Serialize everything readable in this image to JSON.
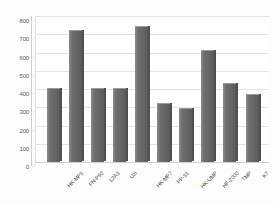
{
  "chart_data": {
    "type": "bar",
    "title": "",
    "xlabel": "",
    "ylabel": "",
    "ylim": [
      0,
      800
    ],
    "yticks": [
      0,
      100,
      200,
      300,
      400,
      500,
      600,
      700,
      800
    ],
    "grid": true,
    "legend": "none",
    "categories": [
      "HK-MP5",
      "FN-P90",
      "L2A3",
      "Uzi",
      "HK-MP7",
      "PP-91",
      "HK-UMP",
      "HF-2000",
      "TMP",
      "K7"
    ],
    "values": [
      400,
      720,
      400,
      400,
      740,
      320,
      290,
      610,
      430,
      370
    ],
    "series": [
      {
        "name": "",
        "values": [
          400,
          720,
          400,
          400,
          740,
          320,
          290,
          610,
          430,
          370
        ]
      }
    ],
    "colors": {
      "bar_fill": "#6f6f6f",
      "bar_edge": "#4f4f4f",
      "bar_highlight": "#8e8e8e",
      "gridline": "#e4e4e4",
      "axis": "#cdcdcd",
      "background": "#fdfdfd",
      "tick_text": "#5a5a5a",
      "category_text": "#4a4a4a"
    }
  },
  "axis": {
    "y_tick_labels": [
      "800",
      "700",
      "600",
      "500",
      "400",
      "300",
      "200",
      "100",
      "0"
    ]
  }
}
